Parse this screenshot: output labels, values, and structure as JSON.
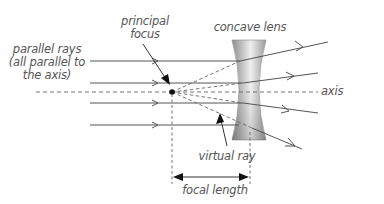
{
  "diagram": {
    "labels": {
      "principal_focus_line1": "principal",
      "principal_focus_line2": "focus",
      "parallel_rays_line1": "parallel rays",
      "parallel_rays_line2": "(all parallel to",
      "parallel_rays_line3": "the axis)",
      "concave_lens": "concave lens",
      "axis": "axis",
      "virtual_ray": "virtual ray",
      "focal_length": "focal length"
    },
    "colors": {
      "ray": "#555555",
      "dashed": "#666666",
      "lens_dark": "#8a8a8a",
      "lens_light": "#e6e6e6",
      "text": "#555555",
      "focus_dot": "#111111"
    },
    "incident_ray_count": 4,
    "elements": [
      "incident parallel rays",
      "principal axis",
      "principal focus",
      "concave lens",
      "refracted diverging rays",
      "virtual rays",
      "focal length dimension"
    ]
  }
}
